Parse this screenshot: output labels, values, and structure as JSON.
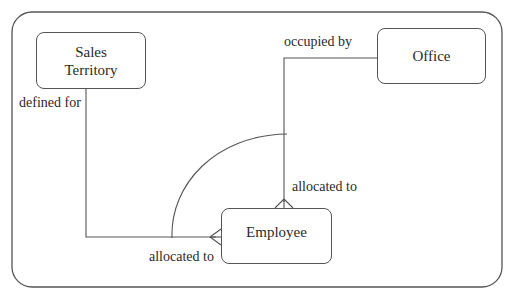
{
  "diagram": {
    "type": "entity-relationship",
    "entities": [
      {
        "id": "sales-territory",
        "label_lines": [
          "Sales",
          "Territory"
        ]
      },
      {
        "id": "office",
        "label": "Office"
      },
      {
        "id": "employee",
        "label": "Employee"
      }
    ],
    "relationships": [
      {
        "from": "sales-territory",
        "to": "employee",
        "label_near_from": "defined for",
        "label_near_to": "allocated to",
        "to_cardinality": "many"
      },
      {
        "from": "office",
        "to": "employee",
        "label_near_from": "occupied by",
        "label_near_to": "allocated to",
        "to_cardinality": "many"
      }
    ],
    "constraint": "exclusive-arc across both Employee relationships",
    "colors": {
      "stroke": "#555555",
      "text": "#2a2a2a",
      "background": "#ffffff"
    }
  },
  "labels": {
    "defined_for": "defined for",
    "occupied_by": "occupied by",
    "allocated_to_office": "allocated to",
    "allocated_to_territory": "allocated to"
  }
}
